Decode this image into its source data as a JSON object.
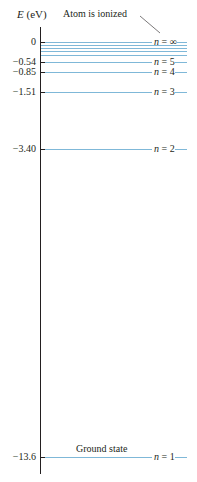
{
  "axis": {
    "title_var": "E",
    "title_unit": "(eV)"
  },
  "levels": [
    {
      "n": "∞",
      "energy": "0",
      "y": 42,
      "tick": true
    },
    {
      "n": "",
      "energy": "",
      "y": 45,
      "tick": false
    },
    {
      "n": "",
      "energy": "",
      "y": 48,
      "tick": false
    },
    {
      "n": "",
      "energy": "",
      "y": 51,
      "tick": false
    },
    {
      "n": "",
      "energy": "",
      "y": 55,
      "tick": false
    },
    {
      "n": "5",
      "energy": "−0.54",
      "y": 62,
      "tick": true
    },
    {
      "n": "4",
      "energy": "−0.85",
      "y": 72,
      "tick": true
    },
    {
      "n": "3",
      "energy": "−1.51",
      "y": 92,
      "tick": true
    },
    {
      "n": "2",
      "energy": "−3.40",
      "y": 149,
      "tick": true
    },
    {
      "n": "1",
      "energy": "−13.6",
      "y": 457,
      "tick": true
    }
  ],
  "annotations": {
    "ionized": "Atom is ionized",
    "ground": "Ground state"
  },
  "n_prefix": "n = ",
  "colors": {
    "level_line": "#7fb8d8",
    "axis": "#231f20"
  }
}
